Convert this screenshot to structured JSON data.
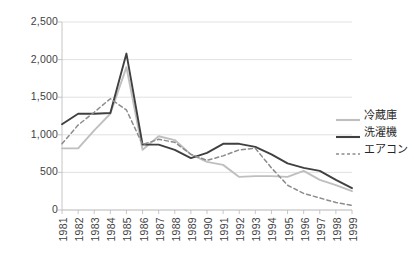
{
  "chart_data": {
    "type": "line",
    "title": "",
    "xlabel": "",
    "ylabel": "",
    "ylim": [
      0,
      2500
    ],
    "y_ticks": [
      "0",
      "500",
      "1,000",
      "1,500",
      "2,000",
      "2,500"
    ],
    "y_tick_values": [
      0,
      500,
      1000,
      1500,
      2000,
      2500
    ],
    "grid": true,
    "legend_position": "right",
    "categories": [
      "1981",
      "1982",
      "1983",
      "1984",
      "1985",
      "1986",
      "1987",
      "1988",
      "1989",
      "1990",
      "1991",
      "1992",
      "1993",
      "1994",
      "1995",
      "1996",
      "1997",
      "1998",
      "1999"
    ],
    "series": [
      {
        "name": "冷蔵庫",
        "color": "#bfbfbf",
        "style": "solid",
        "values": [
          820,
          820,
          1060,
          1280,
          1900,
          800,
          980,
          930,
          740,
          640,
          600,
          440,
          450,
          450,
          440,
          520,
          400,
          330,
          250
        ]
      },
      {
        "name": "洗濯機",
        "color": "#404040",
        "style": "solid",
        "values": [
          1140,
          1280,
          1280,
          1290,
          2080,
          870,
          870,
          800,
          690,
          760,
          880,
          880,
          840,
          740,
          620,
          560,
          520,
          400,
          290
        ]
      },
      {
        "name": "エアコン",
        "color": "#8c8c8c",
        "style": "dashed",
        "values": [
          880,
          1130,
          1300,
          1480,
          1330,
          870,
          940,
          900,
          740,
          660,
          720,
          800,
          820,
          560,
          330,
          220,
          160,
          100,
          60
        ]
      }
    ]
  },
  "legend": {
    "items": [
      {
        "label": "冷蔵庫",
        "color": "#bfbfbf",
        "style": "solid"
      },
      {
        "label": "洗濯機",
        "color": "#404040",
        "style": "solid"
      },
      {
        "label": "エアコン",
        "color": "#8c8c8c",
        "style": "dashed"
      }
    ]
  },
  "caption": {
    "text": ""
  }
}
